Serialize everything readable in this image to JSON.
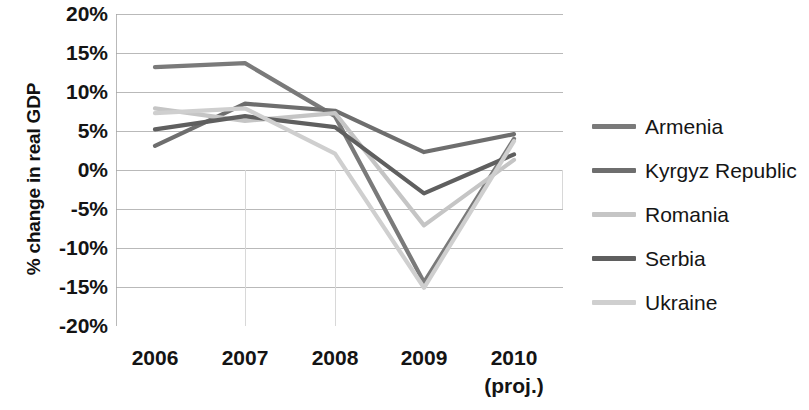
{
  "chart_data": {
    "type": "line",
    "title": "",
    "xlabel": "",
    "ylabel": "% change in real GDP",
    "categories": [
      "2006",
      "2007",
      "2008",
      "2009",
      "2010"
    ],
    "x_tick_sublabels": [
      "",
      "",
      "",
      "",
      "(proj.)"
    ],
    "ylim": [
      -20,
      20
    ],
    "y_ticks": [
      20,
      15,
      10,
      5,
      0,
      -5,
      -10,
      -15,
      -20
    ],
    "y_tick_labels": [
      "20%",
      "15%",
      "10%",
      "5%",
      "0%",
      "-5%",
      "-10%",
      "-15%",
      "-20%"
    ],
    "grid": true,
    "grid_color": "#b9b9b9",
    "legend_position": "right",
    "value_suffix": "%",
    "series": [
      {
        "name": "Armenia",
        "color": "#7a7a7a",
        "values": [
          13.2,
          13.7,
          6.9,
          -14.4,
          4.0
        ]
      },
      {
        "name": "Kyrgyz Republic",
        "color": "#6e6e6e",
        "values": [
          3.1,
          8.5,
          7.6,
          2.3,
          4.6
        ]
      },
      {
        "name": "Romania",
        "color": "#c5c5c5",
        "values": [
          7.9,
          6.3,
          7.3,
          -7.1,
          1.3
        ]
      },
      {
        "name": "Serbia",
        "color": "#5f5f5f",
        "values": [
          5.2,
          6.9,
          5.5,
          -3.0,
          2.0
        ]
      },
      {
        "name": "Ukraine",
        "color": "#cfcfcf",
        "values": [
          7.3,
          7.9,
          2.1,
          -15.1,
          3.7
        ]
      }
    ]
  },
  "legend": {
    "items": [
      {
        "label": "Armenia"
      },
      {
        "label": "Kyrgyz Republic"
      },
      {
        "label": "Romania"
      },
      {
        "label": "Serbia"
      },
      {
        "label": "Ukraine"
      }
    ]
  }
}
